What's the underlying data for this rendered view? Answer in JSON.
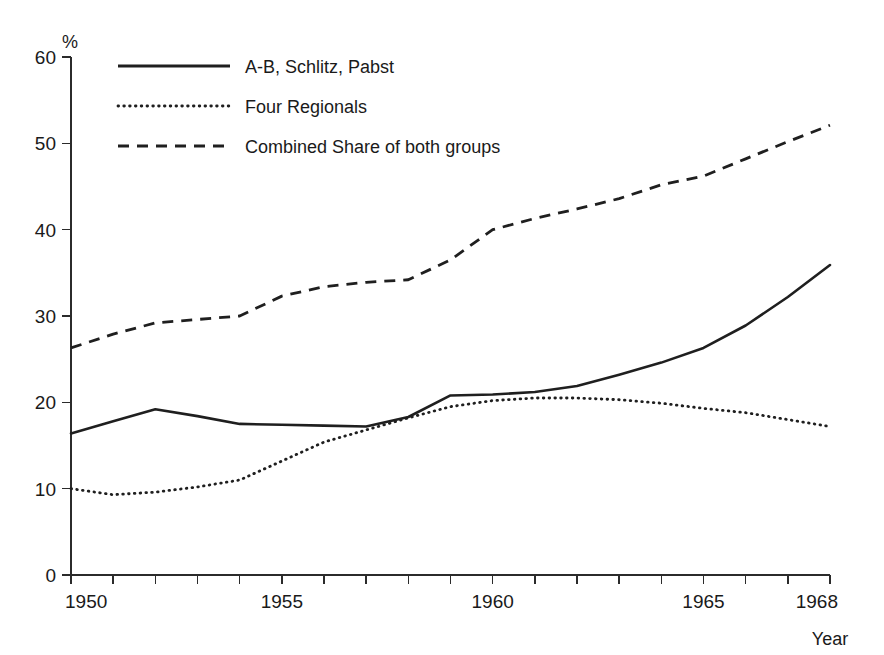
{
  "chart_data": {
    "type": "line",
    "title": "",
    "subtitle": "",
    "xlabel": "Year",
    "ylabel": "%",
    "xlim": [
      1950,
      1968
    ],
    "ylim": [
      0,
      60
    ],
    "grid": false,
    "legend_position": "top-left",
    "x": [
      1950,
      1951,
      1952,
      1953,
      1954,
      1955,
      1956,
      1957,
      1958,
      1959,
      1960,
      1961,
      1962,
      1963,
      1964,
      1965,
      1966,
      1967,
      1968
    ],
    "x_tick_labels": [
      "1950",
      "1955",
      "1960",
      "1965",
      "1968"
    ],
    "x_tick_values": [
      1950,
      1955,
      1960,
      1965,
      1968
    ],
    "y_tick_labels": [
      "0",
      "10",
      "20",
      "30",
      "40",
      "50",
      "60"
    ],
    "y_tick_values": [
      0,
      10,
      20,
      30,
      40,
      50,
      60
    ],
    "series": [
      {
        "name": "A-B, Schlitz, Pabst",
        "style": "solid",
        "color": "#1f1f1f",
        "values": [
          16.4,
          17.8,
          19.2,
          18.4,
          17.5,
          17.4,
          17.3,
          17.2,
          18.3,
          20.8,
          20.9,
          21.2,
          21.9,
          23.2,
          24.6,
          26.3,
          28.9,
          32.2,
          35.9
        ]
      },
      {
        "name": "Four Regionals",
        "style": "dotted",
        "color": "#1f1f1f",
        "values": [
          10.0,
          9.3,
          9.6,
          10.2,
          11.0,
          13.2,
          15.4,
          16.8,
          18.2,
          19.5,
          20.2,
          20.5,
          20.5,
          20.3,
          19.9,
          19.3,
          18.8,
          18.0,
          17.2
        ]
      },
      {
        "name": "Combined Share of both groups",
        "style": "dashed",
        "color": "#1f1f1f",
        "values": [
          26.3,
          27.9,
          29.2,
          29.6,
          30.0,
          32.3,
          33.4,
          33.9,
          34.2,
          36.5,
          40.0,
          41.3,
          42.4,
          43.6,
          45.2,
          46.2,
          48.2,
          50.2,
          52.1
        ]
      }
    ]
  },
  "legend": {
    "items": [
      {
        "label": "A-B, Schlitz, Pabst",
        "style": "solid"
      },
      {
        "label": "Four Regionals",
        "style": "dotted"
      },
      {
        "label": "Combined Share of both groups",
        "style": "dashed"
      }
    ]
  },
  "axes": {
    "y_unit_label": "%",
    "x_axis_label": "Year"
  }
}
